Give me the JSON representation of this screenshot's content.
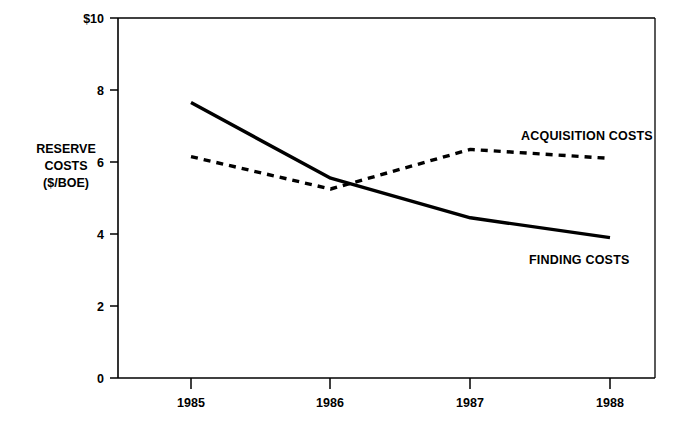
{
  "chart_data": {
    "type": "line",
    "title": "",
    "xlabel": "",
    "ylabel": "RESERVE COSTS ($/BOE)",
    "ylabel_lines": [
      "RESERVE",
      "COSTS",
      "($/BOE)"
    ],
    "categories": [
      "1985",
      "1986",
      "1987",
      "1988"
    ],
    "x": [
      1985,
      1986,
      1987,
      1988
    ],
    "ylim": [
      0,
      10
    ],
    "yticks": [
      0,
      2,
      4,
      6,
      8,
      10
    ],
    "ytick_labels": [
      "0",
      "2",
      "4",
      "6",
      "8",
      "$10"
    ],
    "grid": false,
    "legend_position": "inline-annotations",
    "series": [
      {
        "name": "FINDING COSTS",
        "style": "solid",
        "color": "#000000",
        "values": [
          7.65,
          5.55,
          4.45,
          3.9
        ]
      },
      {
        "name": "ACQUISITION COSTS",
        "style": "dashed",
        "color": "#000000",
        "values": [
          6.15,
          5.25,
          6.35,
          6.1
        ]
      }
    ],
    "annotations": [
      {
        "text": "ACQUISITION COSTS",
        "series": "ACQUISITION COSTS"
      },
      {
        "text": "FINDING COSTS",
        "series": "FINDING COSTS"
      }
    ]
  },
  "axis": {
    "y_tick_0": "0",
    "y_tick_2": "2",
    "y_tick_4": "4",
    "y_tick_6": "6",
    "y_tick_8": "8",
    "y_tick_10": "$10",
    "ylabel_line_1": "RESERVE",
    "ylabel_line_2": "COSTS",
    "ylabel_line_3": "($/BOE)",
    "x_tick_1985": "1985",
    "x_tick_1986": "1986",
    "x_tick_1987": "1987",
    "x_tick_1988": "1988"
  },
  "labels": {
    "acquisition": "ACQUISITION COSTS",
    "finding": "FINDING COSTS"
  },
  "colors": {
    "ink": "#000000",
    "background": "#ffffff"
  }
}
